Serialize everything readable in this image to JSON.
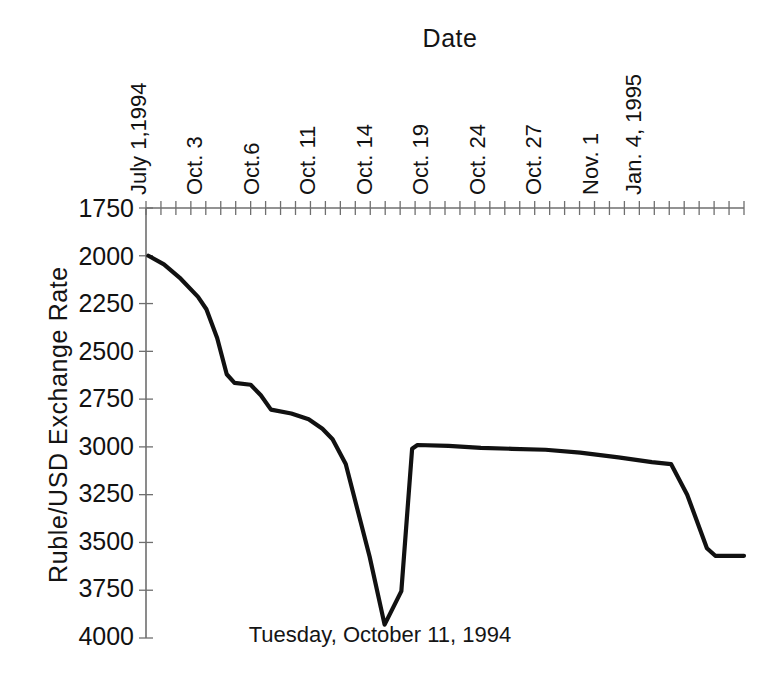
{
  "chart_data": {
    "type": "line",
    "title": "Date",
    "xlabel": "Date",
    "ylabel": "Ruble/USD  Exchange  Rate",
    "annotation": "Tuesday, October 11, 1994",
    "grid": false,
    "legend": null,
    "y_axis_inverted": true,
    "ylim": [
      1750,
      4000
    ],
    "yticks": [
      1750,
      2000,
      2250,
      2500,
      2750,
      3000,
      3250,
      3500,
      3750,
      4000
    ],
    "ytick_labels": [
      "1750",
      "2000",
      "2250",
      "2500",
      "2750",
      "3000",
      "3250",
      "3500",
      "3750",
      "4000"
    ],
    "xtick_labels": [
      "July 1,1994",
      "Oct. 3",
      "Oct.6",
      "Oct. 11",
      "Oct. 14",
      "Oct. 19",
      "Oct. 24",
      "Oct. 27",
      "Nov. 1",
      "Jan. 4, 1995"
    ],
    "xtick_positions": [
      0.0,
      0.105,
      0.212,
      0.318,
      0.424,
      0.53,
      0.636,
      0.742,
      0.848,
      0.925
    ],
    "x": [
      "July 1, 1994",
      "Sep. 20",
      "Sep. 28",
      "Oct. 3",
      "Oct. 4",
      "Oct. 5",
      "Oct. 6",
      "Oct. 7",
      "Oct. 10",
      "Oct. 11 (peak)",
      "Oct. 11 (close)",
      "Oct. 12",
      "Oct. 14",
      "Oct. 17",
      "Oct. 19",
      "Oct. 21",
      "Oct. 24",
      "Oct. 26",
      "Oct. 27",
      "Oct. 31",
      "Nov. 1",
      "Nov. 15",
      "Dec. 1",
      "Dec. 20",
      "Jan. 4, 1995"
    ],
    "y": [
      2000,
      2075,
      2170,
      2290,
      2460,
      2620,
      2665,
      2680,
      2800,
      2815,
      2860,
      2905,
      2930,
      3080,
      3560,
      3930,
      3760,
      3010,
      2995,
      3010,
      3015,
      3025,
      3035,
      3060,
      3090
    ],
    "series": [
      {
        "name": "Ruble/USD Exchange Rate",
        "color": "#111111",
        "points": [
          {
            "x_frac": 0.004,
            "value": 2000
          },
          {
            "x_frac": 0.03,
            "value": 2045
          },
          {
            "x_frac": 0.058,
            "value": 2120
          },
          {
            "x_frac": 0.087,
            "value": 2215
          },
          {
            "x_frac": 0.101,
            "value": 2280
          },
          {
            "x_frac": 0.119,
            "value": 2430
          },
          {
            "x_frac": 0.135,
            "value": 2620
          },
          {
            "x_frac": 0.148,
            "value": 2665
          },
          {
            "x_frac": 0.175,
            "value": 2675
          },
          {
            "x_frac": 0.192,
            "value": 2730
          },
          {
            "x_frac": 0.209,
            "value": 2805
          },
          {
            "x_frac": 0.243,
            "value": 2825
          },
          {
            "x_frac": 0.272,
            "value": 2855
          },
          {
            "x_frac": 0.295,
            "value": 2905
          },
          {
            "x_frac": 0.312,
            "value": 2960
          },
          {
            "x_frac": 0.334,
            "value": 3090
          },
          {
            "x_frac": 0.374,
            "value": 3575
          },
          {
            "x_frac": 0.399,
            "value": 3930
          },
          {
            "x_frac": 0.427,
            "value": 3755
          },
          {
            "x_frac": 0.445,
            "value": 3010
          },
          {
            "x_frac": 0.454,
            "value": 2990
          },
          {
            "x_frac": 0.506,
            "value": 2995
          },
          {
            "x_frac": 0.56,
            "value": 3005
          },
          {
            "x_frac": 0.612,
            "value": 3010
          },
          {
            "x_frac": 0.668,
            "value": 3015
          },
          {
            "x_frac": 0.726,
            "value": 3030
          },
          {
            "x_frac": 0.79,
            "value": 3055
          },
          {
            "x_frac": 0.846,
            "value": 3080
          },
          {
            "x_frac": 0.878,
            "value": 3090
          },
          {
            "x_frac": 0.905,
            "value": 3250
          },
          {
            "x_frac": 0.938,
            "value": 3530
          },
          {
            "x_frac": 0.952,
            "value": 3570
          },
          {
            "x_frac": 1.0,
            "value": 3570
          }
        ]
      }
    ]
  },
  "axis": {
    "minor_tick_count": 40,
    "axis_color": "#6f6f6f",
    "line_color": "#111111"
  }
}
